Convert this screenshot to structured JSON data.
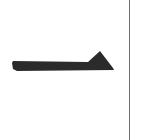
{
  "canvas": {
    "width": 142,
    "height": 140,
    "background_color": "#ffffff",
    "label": "glyph canvas"
  },
  "glyph": {
    "name": "arrow-pointer-glyph",
    "description": "tapered horizontal bar with triangular peak near right end",
    "fill_color": "#2b2b2b",
    "bar": {
      "left_x": 12,
      "right_x": 113,
      "top_y": 61,
      "bottom_y": 69,
      "left_thickness": 5,
      "right_thickness": 8
    },
    "triangle": {
      "apex_x": 100,
      "apex_y": 51,
      "base_left_x": 87,
      "base_right_x": 114,
      "base_y": 69
    },
    "tail_notch": {
      "x": 12,
      "y": 69,
      "width": 5,
      "height": 3
    },
    "path": "M 12 63 L 13 61 L 88 62 L 100 51 L 113 68 L 114 70 L 17 71 L 13 69 L 12 63 Z"
  },
  "divider": {
    "name": "vertical-rule",
    "x": 129,
    "width": 1,
    "color": "#6f6f6f",
    "top_y": 0,
    "bottom_y": 140
  },
  "meta": {
    "alt_text": "Dark arrow-like glyph on white background with a vertical rule on the right"
  }
}
